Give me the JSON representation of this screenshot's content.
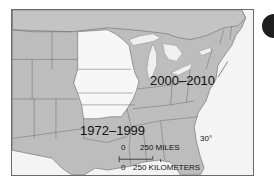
{
  "map": {
    "colors": {
      "land": "#bdbdbd",
      "highlight_region": "#f7f7f7",
      "water": "#f4f4f4",
      "lakes": "#f0f0f0",
      "borders": "#6a6a6a",
      "frame": "#6b6b6b",
      "marker": "#1e1e1e"
    },
    "labels": {
      "period_recent": "2000–2010",
      "period_earlier": "1972–1999",
      "latitude": "30°"
    },
    "scale": {
      "miles_zero": "0",
      "miles_label": "250 MILES",
      "km_zero": "0",
      "km_label": "250 KILOMETERS"
    }
  }
}
